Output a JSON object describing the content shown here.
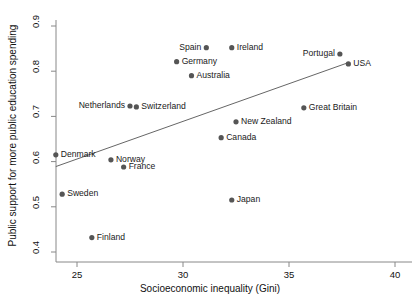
{
  "chart_data": {
    "type": "scatter",
    "title": "",
    "xlabel": "Socioeconomic inequality (Gini)",
    "ylabel": "Public support for more public education spending",
    "xlim": [
      24,
      40
    ],
    "ylim": [
      0.39,
      0.9
    ],
    "xticks": [
      25,
      30,
      35,
      40
    ],
    "xtick_labels": [
      "25",
      "30",
      "35",
      "40"
    ],
    "yticks": [
      0.4,
      0.5,
      0.6,
      0.7,
      0.8,
      0.9
    ],
    "ytick_labels": [
      "0.4",
      "0.5",
      "0.6",
      "0.7",
      "0.8",
      "0.9"
    ],
    "grid": false,
    "legend": "none",
    "point_color": "#555555",
    "line_color": "#666666",
    "axis_color": "#888888",
    "points": [
      {
        "label": "Spain",
        "x": 31.1,
        "y": 0.852,
        "label_pos": "left"
      },
      {
        "label": "Ireland",
        "x": 32.3,
        "y": 0.852,
        "label_pos": "right"
      },
      {
        "label": "Germany",
        "x": 29.7,
        "y": 0.821,
        "label_pos": "right"
      },
      {
        "label": "Australia",
        "x": 30.4,
        "y": 0.79,
        "label_pos": "right"
      },
      {
        "label": "Portugal",
        "x": 37.4,
        "y": 0.838,
        "label_pos": "left"
      },
      {
        "label": "USA",
        "x": 37.8,
        "y": 0.816,
        "label_pos": "right"
      },
      {
        "label": "Netherlands",
        "x": 27.5,
        "y": 0.723,
        "label_pos": "left"
      },
      {
        "label": "Switzerland",
        "x": 27.8,
        "y": 0.721,
        "label_pos": "right"
      },
      {
        "label": "Great Britain",
        "x": 35.7,
        "y": 0.719,
        "label_pos": "right"
      },
      {
        "label": "New Zealand",
        "x": 32.5,
        "y": 0.688,
        "label_pos": "right"
      },
      {
        "label": "Canada",
        "x": 31.8,
        "y": 0.653,
        "label_pos": "right"
      },
      {
        "label": "Denmark",
        "x": 24.0,
        "y": 0.615,
        "label_pos": "right"
      },
      {
        "label": "Norway",
        "x": 26.6,
        "y": 0.604,
        "label_pos": "right"
      },
      {
        "label": "France",
        "x": 27.2,
        "y": 0.588,
        "label_pos": "right"
      },
      {
        "label": "Sweden",
        "x": 24.3,
        "y": 0.528,
        "label_pos": "right"
      },
      {
        "label": "Japan",
        "x": 32.3,
        "y": 0.515,
        "label_pos": "right"
      },
      {
        "label": "Finland",
        "x": 25.7,
        "y": 0.432,
        "label_pos": "right"
      }
    ],
    "fit_line": {
      "x0": 24.0,
      "y0": 0.589,
      "x1": 37.8,
      "y1": 0.819
    }
  }
}
